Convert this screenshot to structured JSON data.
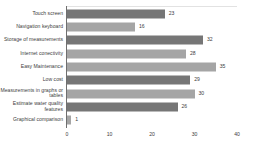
{
  "chart_data": {
    "type": "bar",
    "orientation": "horizontal",
    "title": "",
    "xlabel": "",
    "ylabel": "",
    "xlim": [
      0,
      40
    ],
    "grid": false,
    "legend": null,
    "xticks": [
      "0",
      "10",
      "20",
      "30",
      "40"
    ],
    "xtick_values": [
      0,
      10,
      20,
      30,
      40
    ],
    "categories": [
      "Touch screen",
      "Navigation keyboard",
      "Storage of measurements",
      "Internet conectivity",
      "Easy Maintenance",
      "Low cost",
      "Measurements in graphs or tables",
      "Estimate water quality features",
      "Graphical comparison"
    ],
    "values": [
      23,
      16,
      32,
      28,
      35,
      29,
      30,
      26,
      1
    ],
    "value_labels": [
      "23",
      "16",
      "32",
      "28",
      "35",
      "29",
      "30",
      "26",
      "1"
    ],
    "bar_colors": [
      "#767676",
      "#a5a5a5",
      "#767676",
      "#a5a5a5",
      "#a5a5a5",
      "#767676",
      "#a5a5a5",
      "#767676",
      "#a5a5a5"
    ]
  },
  "colors": {
    "bar_dark": "#767676",
    "bar_light": "#a5a5a5",
    "axis": "#6f6f6f",
    "text": "#3d3d3d",
    "background": "#ffffff"
  }
}
